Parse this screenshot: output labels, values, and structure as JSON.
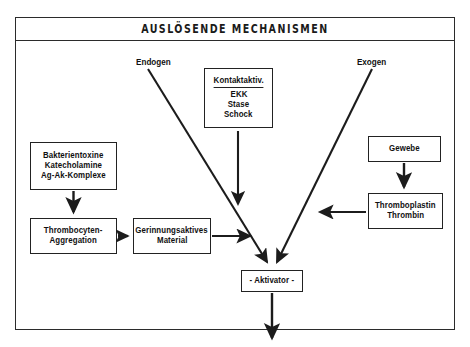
{
  "header": {
    "title": "AUSLÖSENDE MECHANISMEN"
  },
  "labels": {
    "endogen": "Endogen",
    "exogen": "Exogen"
  },
  "nodes": {
    "bakterientoxine": {
      "lines": [
        "Bakterientoxine",
        "Katecholamine",
        "Ag-Ak-Komplexe"
      ]
    },
    "thrombocyten": {
      "lines": [
        "Thrombocyten-",
        "Aggregation"
      ]
    },
    "gerinnungsaktives": {
      "lines": [
        "Gerinnungsaktives",
        "Material"
      ]
    },
    "kontaktaktiv": {
      "header": "Kontaktaktiv.",
      "lines": [
        "EKK",
        "Stase",
        "Schock"
      ]
    },
    "gewebe": {
      "lines": [
        "Gewebe"
      ]
    },
    "thromboplastin": {
      "lines": [
        "Thromboplastin",
        "Thrombin"
      ]
    },
    "aktivator": {
      "lines": [
        "- Aktivator -"
      ]
    }
  },
  "colors": {
    "line": "#222222",
    "frame": "#2b2b2b",
    "background": "#ffffff"
  }
}
